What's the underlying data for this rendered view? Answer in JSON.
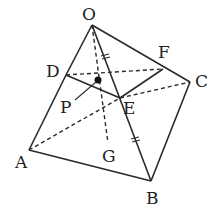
{
  "diagram": {
    "type": "geometry",
    "points": {
      "O": {
        "label": "O",
        "x": 92,
        "y": 25,
        "lx": 82,
        "ly": 20
      },
      "A": {
        "label": "A",
        "x": 29,
        "y": 150,
        "lx": 15,
        "ly": 168
      },
      "B": {
        "label": "B",
        "x": 151,
        "y": 181,
        "lx": 146,
        "ly": 204
      },
      "C": {
        "label": "C",
        "x": 190,
        "y": 82,
        "lx": 195,
        "ly": 86
      },
      "D": {
        "label": "D",
        "x": 66,
        "y": 75,
        "lx": 46,
        "ly": 77
      },
      "E": {
        "label": "E",
        "x": 120,
        "y": 98,
        "lx": 123,
        "ly": 113
      },
      "F": {
        "label": "F",
        "x": 163,
        "y": 69,
        "lx": 158,
        "ly": 58
      },
      "G": {
        "label": "G",
        "x": 108,
        "y": 143,
        "lx": 102,
        "ly": 162
      },
      "P": {
        "label": "P",
        "x": 98,
        "y": 80,
        "lx": 60,
        "ly": 112
      }
    },
    "solid_segments": [
      [
        "O",
        "D"
      ],
      [
        "O",
        "C"
      ],
      [
        "D",
        "A"
      ],
      [
        "A",
        "B"
      ],
      [
        "B",
        "C"
      ],
      [
        "O",
        "B"
      ],
      [
        "D",
        "E"
      ],
      [
        "E",
        "F"
      ]
    ],
    "dashed_segments": [
      [
        "D",
        "F"
      ],
      [
        "A",
        "E"
      ],
      [
        "E",
        "C"
      ],
      [
        "O",
        "G"
      ]
    ],
    "tick_marks": [
      "OE",
      "EB"
    ],
    "pointer": {
      "from": "P-label",
      "to": "P"
    }
  }
}
